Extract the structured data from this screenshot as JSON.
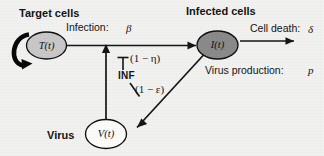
{
  "figure": {
    "type": "diagram",
    "name": "target-cell-limited viral dynamics model with interferon",
    "background_color": "#f1f1f0",
    "stroke_color": "#151515"
  },
  "headings": {
    "target_cells": "Target cells",
    "infected_cells": "Infected cells"
  },
  "nodes": [
    {
      "id": "target",
      "label": "T(t)",
      "fill": "#c8c8c8",
      "heading": "Target cells"
    },
    {
      "id": "infected",
      "label": "I(t)",
      "fill": "#8a8a8a",
      "heading": "Infected cells"
    },
    {
      "id": "virus",
      "label": "V(t)",
      "fill": "#fbfbfa",
      "heading": "Virus"
    }
  ],
  "virus_label": "Virus",
  "edges": [
    {
      "id": "proliferation",
      "from": "target",
      "to": "target",
      "label": "",
      "style": "thick-self-loop"
    },
    {
      "id": "infection",
      "from": "target",
      "to": "infected",
      "label": "Infection:",
      "parameter": "β"
    },
    {
      "id": "cell-death",
      "from": "infected",
      "to": "outside",
      "label": "Cell death:",
      "parameter": "δ"
    },
    {
      "id": "virus-production",
      "from": "infected",
      "to": "virus",
      "label": "Virus production:",
      "parameter": "p"
    },
    {
      "id": "virus-infects-target",
      "from": "virus",
      "to": "infection",
      "label": "",
      "parameter": ""
    }
  ],
  "interferon": {
    "label": "INF",
    "blocks_infection": "(1 − η)",
    "blocks_production": "(1 − ε)"
  },
  "annotations": {
    "infection_text": "Infection:",
    "infection_param": "β",
    "cell_death_text": "Cell death:",
    "cell_death_param": "δ",
    "virus_production_text": "Virus production:",
    "virus_production_param": "p",
    "eta_term": "(1 − η)",
    "epsilon_term": "(1 − ε)",
    "inf_label": "INF"
  }
}
